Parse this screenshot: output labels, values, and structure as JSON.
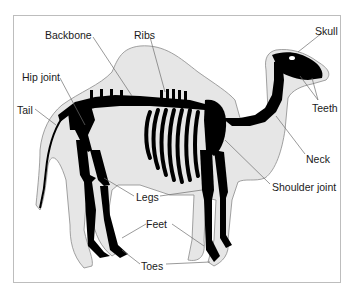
{
  "diagram": {
    "colors": {
      "body_fill": "#e6e6e6",
      "body_outline": "#8a8a8a",
      "bone": "#000000",
      "leader_line": "#6e6e6e",
      "frame": "#bdbdbd"
    },
    "labels": [
      {
        "id": "backbone",
        "text": "Backbone",
        "x": 45,
        "y": 29
      },
      {
        "id": "ribs",
        "text": "Ribs",
        "x": 134,
        "y": 29
      },
      {
        "id": "skull",
        "text": "Skull",
        "x": 315,
        "y": 25
      },
      {
        "id": "hip-joint",
        "text": "Hip joint",
        "x": 22,
        "y": 71
      },
      {
        "id": "tail",
        "text": "Tail",
        "x": 17,
        "y": 104
      },
      {
        "id": "teeth",
        "text": "Teeth",
        "x": 312,
        "y": 102
      },
      {
        "id": "neck",
        "text": "Neck",
        "x": 306,
        "y": 153
      },
      {
        "id": "shoulder-joint",
        "text": "Shoulder joint",
        "x": 272,
        "y": 181
      },
      {
        "id": "legs",
        "text": "Legs",
        "x": 136,
        "y": 191
      },
      {
        "id": "feet",
        "text": "Feet",
        "x": 146,
        "y": 218
      },
      {
        "id": "toes",
        "text": "Toes",
        "x": 141,
        "y": 260
      }
    ]
  }
}
